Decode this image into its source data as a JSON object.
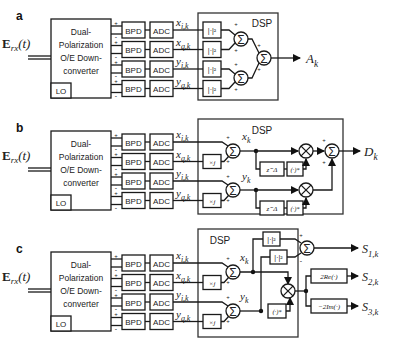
{
  "panels": [
    {
      "label": "a",
      "input": "E",
      "input_sub": "rx",
      "input_arg": "(t)",
      "downconverter": [
        "Dual-",
        "Polarization",
        "O/E Down-",
        "converter"
      ],
      "lo": "LO",
      "bpd": "BPD",
      "adc": "ADC",
      "signals": [
        [
          "x",
          "i,k"
        ],
        [
          "x",
          "q,k"
        ],
        [
          "y",
          "i,k"
        ],
        [
          "y",
          "q,k"
        ]
      ],
      "dsp": "DSP",
      "abs_sq": "|·|²",
      "sum": "Σ",
      "output": [
        "A",
        "k"
      ]
    },
    {
      "label": "b",
      "dsp": "DSP",
      "times_j": "×j",
      "sum": "Σ",
      "mult": "⊗",
      "delay": "z⁻Δ",
      "conj": "(·)*",
      "xk": [
        "x",
        "k"
      ],
      "yk": [
        "y",
        "k"
      ],
      "output": [
        "D",
        "k"
      ]
    },
    {
      "label": "c",
      "dsp": "DSP",
      "times_j": "×j",
      "abs_sq": "|·|²",
      "conj": "(·)*",
      "re": "2Re(·)",
      "im": "−2Im(·)",
      "xk": [
        "x",
        "k"
      ],
      "yk": [
        "y",
        "k"
      ],
      "outputs": [
        [
          "S",
          "1,k"
        ],
        [
          "S",
          "2,k"
        ],
        [
          "S",
          "3,k"
        ]
      ]
    }
  ],
  "plus": "+",
  "minus": "-"
}
